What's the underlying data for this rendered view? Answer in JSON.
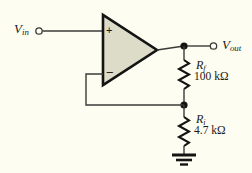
{
  "figure": {
    "name": "non-inverting-opamp-amplifier",
    "background_color": "#fdfdf2",
    "wire_color": "#3a3a38",
    "ink_color": "#1a1a18",
    "opamp_fill_color": "#dcdcc8"
  },
  "labels": {
    "input": {
      "symbol": "V",
      "subscript": "in"
    },
    "output": {
      "symbol": "V",
      "subscript": "out"
    },
    "feedback_resistor": {
      "symbol": "R",
      "subscript": "f",
      "value": "100 kΩ"
    },
    "input_resistor": {
      "symbol": "R",
      "subscript": "i",
      "value": "4.7 kΩ"
    }
  },
  "opamp": {
    "noninverting_sign": "+",
    "inverting_sign": "−"
  },
  "nodes": {
    "output_node": "output-junction",
    "divider_node": "feedback-divider-junction",
    "ground": "ground-symbol"
  }
}
